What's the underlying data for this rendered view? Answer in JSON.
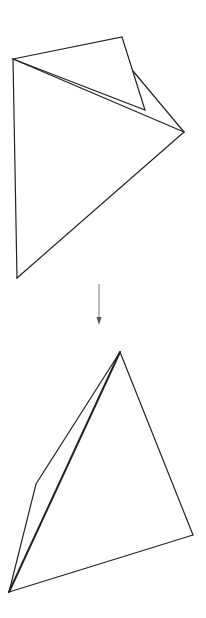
{
  "diagram": {
    "title": "",
    "stroke_color": "#222222",
    "background": "#ffffff",
    "figures": [
      {
        "name": "before",
        "description": "Folded sheet: large triangle with a small flap folded over the top",
        "vertices": {
          "top_left": [
            13,
            59
          ],
          "top_right": [
            122,
            37
          ],
          "inner_fold": [
            145,
            110
          ],
          "right": [
            184,
            132
          ],
          "bottom_left": [
            17,
            278
          ],
          "fold_junction": [
            133,
            71
          ]
        },
        "edges": [
          {
            "from": "top_left",
            "to": "top_right"
          },
          {
            "from": "top_right",
            "to": "inner_fold"
          },
          {
            "from": "inner_fold",
            "to": "top_left"
          },
          {
            "from": "fold_junction",
            "to": "right"
          },
          {
            "from": "top_left",
            "to": "right"
          },
          {
            "from": "top_left",
            "to": "bottom_left"
          },
          {
            "from": "bottom_left",
            "to": "right"
          }
        ]
      },
      {
        "name": "after",
        "description": "Tetrahedron-like shape with emphasized diagonal",
        "vertices": {
          "top": [
            120,
            352
          ],
          "right": [
            193,
            535
          ],
          "bottom_left": [
            9,
            592
          ],
          "left_bend": [
            36,
            484
          ]
        },
        "edges": [
          {
            "from": "top",
            "to": "right"
          },
          {
            "from": "right",
            "to": "bottom_left"
          },
          {
            "from": "bottom_left",
            "to": "left_bend"
          },
          {
            "from": "left_bend",
            "to": "top"
          },
          {
            "from": "top",
            "to": "bottom_left",
            "bold": true
          }
        ]
      }
    ],
    "arrow": {
      "direction": "down",
      "x": 99,
      "y_start": 284,
      "y_end": 324
    }
  }
}
